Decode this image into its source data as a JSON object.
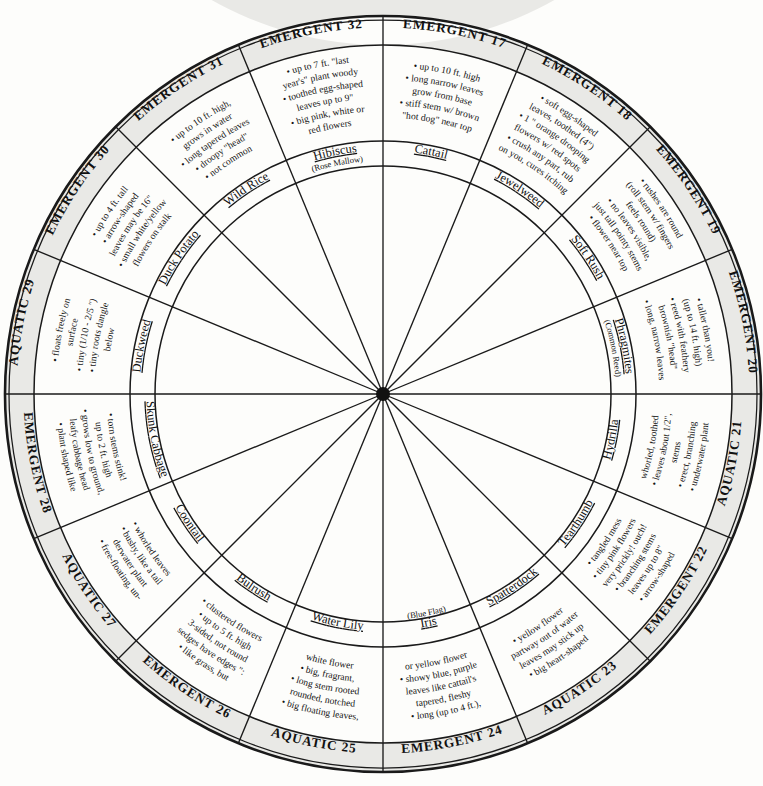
{
  "diagram": {
    "kind": "circular-identification-wheel",
    "segment_count": 16,
    "number_range": "17-32",
    "center": {
      "x": 383,
      "y": 394
    },
    "radii": {
      "outer": 378,
      "header_inner": 349,
      "detail_inner": 253,
      "name_inner": 228
    },
    "colors": {
      "ink": "#111111",
      "band": "#e9e9e6",
      "paper": "#fdfdfb"
    }
  },
  "segments": [
    {
      "id": "seg-17",
      "category": "EMERGENT",
      "number": "17",
      "name": "Cattail",
      "name_sub": "",
      "details": [
        "up to 10 ft. high",
        "long narrow leaves",
        "grow from base",
        "stiff stem w/ brown",
        "\"hot dog\" near top"
      ],
      "detail_lines": [
        "• up to 10 ft. high",
        "• long narrow leaves",
        "grow from base",
        "• stiff stem w/ brown",
        "\"hot dog\" near top"
      ]
    },
    {
      "id": "seg-18",
      "category": "EMERGENT",
      "number": "18",
      "name": "Jewelweed",
      "name_sub": "",
      "details": [
        "soft egg-shaped leaves, toothed (4\")",
        "1\" orange drooping flowers w/ red spots",
        "crush any part, rub on you, cures itching"
      ],
      "detail_lines": [
        "• soft egg-shaped",
        "leaves, toothed (4\")",
        "• 1 \" orange drooping",
        "flowers w/ red spots",
        "• crush any part, rub",
        "on you, cures itching"
      ]
    },
    {
      "id": "seg-19",
      "category": "EMERGENT",
      "number": "19",
      "name": "Soft Rush",
      "name_sub": "",
      "details": [
        "rushes are round (roll stem w/ fingers feels round)",
        "no leaves visible, just tall pointy stems",
        "flower near top"
      ],
      "detail_lines": [
        "• rushes are round",
        "(roll stem w/ fingers",
        "feels round)",
        "• no leaves visible,",
        "just tall pointy stems",
        "• flower near top"
      ]
    },
    {
      "id": "seg-20",
      "category": "EMERGENT",
      "number": "20",
      "name": "Phragmites",
      "name_sub": "(Common Reed)",
      "details": [
        "taller than you! (up to 14 ft. high)",
        "reed with feathery brownish \"head\"",
        "long, narrow leaves"
      ],
      "detail_lines": [
        "• taller than you!",
        "(up to 14 ft. high)",
        "• reed with feathery",
        "brownish \"head\"",
        "• long, narrow leaves"
      ]
    },
    {
      "id": "seg-21",
      "category": "AQUATIC",
      "number": "21",
      "name": "Hydrilla",
      "name_sub": "",
      "details": [
        "underwater plant",
        "erect, branching stems",
        "leaves about 1/2\", whorled, toothed"
      ],
      "detail_lines": [
        "• underwater plant",
        "• erect, branching",
        "stems",
        "• leaves about 1/2\",",
        "whorled, toothed"
      ]
    },
    {
      "id": "seg-22",
      "category": "EMERGENT",
      "number": "22",
      "name": "Tearthumb",
      "name_sub": "",
      "details": [
        "arrow-shaped leaves up to 8\"",
        "branching stems very prickly! ouch!",
        "tiny pink flowers",
        "tangled mess"
      ],
      "detail_lines": [
        "• arrow-shaped",
        "leaves up to 8\"",
        "• branching stems",
        "very prickly! ouch!",
        "• tiny pink flowers",
        "• tangled mess"
      ]
    },
    {
      "id": "seg-23",
      "category": "AQUATIC",
      "number": "23",
      "name": "Spatterdock",
      "name_sub": "",
      "details": [
        "big heart-shaped leaves may stick up partway out of water",
        "yellow flower"
      ],
      "detail_lines": [
        "• big heart-shaped",
        "leaves may stick up",
        "partway out of water",
        "• yellow flower"
      ]
    },
    {
      "id": "seg-24",
      "category": "EMERGENT",
      "number": "24",
      "name": "Iris",
      "name_sub": "(Blue Flag)",
      "details": [
        "long (up to 4 ft.), tapered, fleshy leaves like cattail's",
        "showy blue, purple or yellow flower"
      ],
      "detail_lines": [
        "• long (up to 4 ft.),",
        "tapered, fleshy",
        "leaves like cattail's",
        "• showy blue, purple",
        "or yellow flower"
      ]
    },
    {
      "id": "seg-25",
      "category": "AQUATIC",
      "number": "25",
      "name": "Water Lily",
      "name_sub": "",
      "details": [
        "big floating leaves, rounded, notched",
        "long stem rooted",
        "big, fragrant, white flower"
      ],
      "detail_lines": [
        "• big floating leaves,",
        "rounded, notched",
        "• long stem rooted",
        "• big, fragrant,",
        "white flower"
      ]
    },
    {
      "id": "seg-26",
      "category": "EMERGENT",
      "number": "26",
      "name": "Bulrush",
      "name_sub": "",
      "details": [
        "like grass, but sedges have edges\": 3-sided, not round",
        "up to 5 ft. high",
        "clustered flowers"
      ],
      "detail_lines": [
        "• like grass, but",
        "sedges have edges \":",
        "3-sided, not round",
        "• up to 5 ft. high",
        "• clustered flowers"
      ]
    },
    {
      "id": "seg-27",
      "category": "AQUATIC",
      "number": "27",
      "name": "Coontail",
      "name_sub": "",
      "details": [
        "free-floating, underwater plant",
        "bushy, like a tail",
        "whorled leaves"
      ],
      "detail_lines": [
        "• free-floating, un-",
        "derwater plant",
        "• bushy, like a tail",
        "• whorled leaves"
      ]
    },
    {
      "id": "seg-28",
      "category": "EMERGENT",
      "number": "28",
      "name": "Skunk Cabbage",
      "name_sub": "",
      "details": [
        "plant shaped like leafy cabbage head",
        "grows low to ground, up to 2 ft. high",
        "torn stems stink!"
      ],
      "detail_lines": [
        "• plant shaped like",
        "leafy cabbage head",
        "• grows low to ground,",
        "up to 2 ft. high",
        "• torn stems stink!"
      ]
    },
    {
      "id": "seg-29",
      "category": "AQUATIC",
      "number": "29",
      "name": "Duckweed",
      "name_sub": "",
      "details": [
        "floats freely on surface",
        "tiny (1/10 - 2/5 \")",
        "tiny roots dangle below"
      ],
      "detail_lines": [
        "• floats freely on",
        "surface",
        "• tiny (1/10 - 2/5 \")",
        "• tiny roots dangle",
        "below"
      ]
    },
    {
      "id": "seg-30",
      "category": "EMERGENT",
      "number": "30",
      "name": "Duck Potato",
      "name_sub": "",
      "details": [
        "up to 4 ft. tall",
        "arrow-shaped leaves may be 16\"",
        "small white/yellow flowers on stalk"
      ],
      "detail_lines": [
        "• up to 4 ft. tall",
        "• arrow-shaped",
        "leaves may be 16\"",
        "• small white/yellow",
        "flowers on stalk"
      ]
    },
    {
      "id": "seg-31",
      "category": "EMERGENT",
      "number": "31",
      "name": "Wild Rice",
      "name_sub": "",
      "details": [
        "up to 10 ft. high, grows in water",
        "long tapered leaves",
        "droopy \"head\"",
        "not common"
      ],
      "detail_lines": [
        "• up to 10 ft. high,",
        "grows in water",
        "• long tapered leaves",
        "• droopy \"head\"",
        "• not common"
      ]
    },
    {
      "id": "seg-32",
      "category": "EMERGENT",
      "number": "32",
      "name": "Hibiscus",
      "name_sub": "(Rose Mallow)",
      "details": [
        "up to 7 ft. \"last year's\" plant woody",
        "toothed egg-shaped leaves up to 9\"",
        "big pink, white or red flowers"
      ],
      "detail_lines": [
        "• up to 7 ft. \"last",
        "year's\" plant woody",
        "• toothed egg-shaped",
        "leaves up to 9\"",
        "• big pink, white or",
        "red flowers"
      ]
    }
  ]
}
